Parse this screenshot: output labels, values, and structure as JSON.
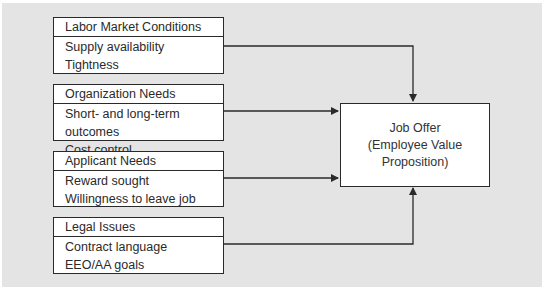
{
  "diagram": {
    "factors": [
      {
        "title": "Labor Market Conditions",
        "items": [
          "Supply availability",
          "Tightness"
        ]
      },
      {
        "title": "Organization Needs",
        "items": [
          "Short- and long-term outcomes",
          "Cost control"
        ]
      },
      {
        "title": "Applicant Needs",
        "items": [
          "Reward sought",
          "Willingness to leave job"
        ]
      },
      {
        "title": "Legal Issues",
        "items": [
          "Contract language",
          "EEO/AA goals"
        ]
      }
    ],
    "target": {
      "lines": [
        "Job Offer",
        "(Employee Value",
        "Proposition)"
      ]
    },
    "colors": {
      "background": "#e4e4e4",
      "box_fill": "#ffffff",
      "line": "#2a2a2a"
    }
  }
}
